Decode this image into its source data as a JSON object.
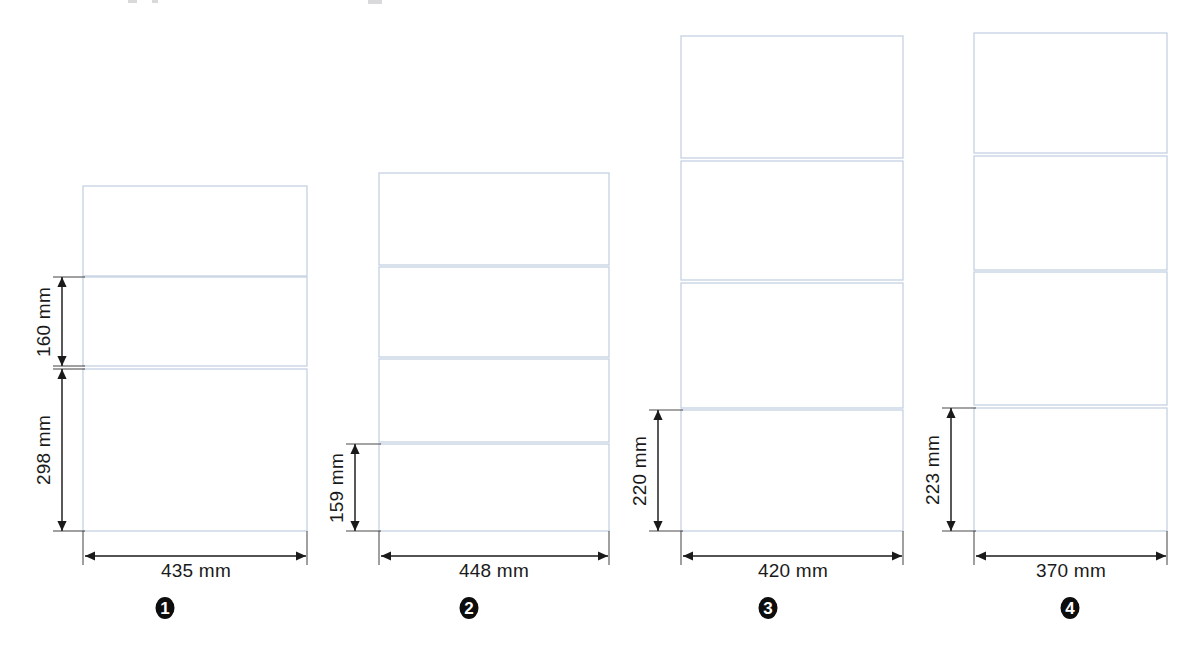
{
  "page": {
    "background_color": "#ffffff",
    "panel_stroke_color": "#c2cfe2",
    "dimension_stroke_color": "#1a1a1a",
    "marker_fill_color": "#0d0d0d",
    "marker_text_color": "#ffffff",
    "unit": "mm"
  },
  "figures": [
    {
      "id": "figure-1",
      "marker_label": "1",
      "marker_x": 165,
      "marker_y": 608,
      "panel_left": 83,
      "panel_right": 307,
      "panels": [
        {
          "name": "panel-top",
          "top": 186,
          "bottom": 276
        },
        {
          "name": "panel-middle",
          "top": 277,
          "bottom": 366
        },
        {
          "name": "panel-bottom",
          "top": 369,
          "bottom": 531
        }
      ],
      "vertical_dimensions": [
        {
          "name": "height-dim-160",
          "label": "160 mm",
          "value": 160,
          "line_x": 62,
          "top": 277,
          "bottom": 366,
          "text_x": 50,
          "text_y": 322
        },
        {
          "name": "height-dim-298",
          "label": "298 mm",
          "value": 298,
          "line_x": 62,
          "top": 369,
          "bottom": 531,
          "text_x": 50,
          "text_y": 450
        }
      ],
      "width_dimension": {
        "name": "width-dim-435",
        "label": "435 mm",
        "value": 435,
        "line_y": 556,
        "left": 85,
        "right": 306,
        "text_x": 196,
        "text_y": 577
      }
    },
    {
      "id": "figure-2",
      "marker_label": "2",
      "marker_x": 469,
      "marker_y": 608,
      "panel_left": 379,
      "panel_right": 609,
      "panels": [
        {
          "name": "panel-1",
          "top": 173,
          "bottom": 265
        },
        {
          "name": "panel-2",
          "top": 267,
          "bottom": 357
        },
        {
          "name": "panel-3",
          "top": 359,
          "bottom": 442
        },
        {
          "name": "panel-4",
          "top": 444,
          "bottom": 531
        }
      ],
      "vertical_dimensions": [
        {
          "name": "height-dim-159",
          "label": "159 mm",
          "value": 159,
          "line_x": 355,
          "top": 444,
          "bottom": 531,
          "text_x": 343,
          "text_y": 488
        }
      ],
      "width_dimension": {
        "name": "width-dim-448",
        "label": "448 mm",
        "value": 448,
        "line_y": 556,
        "left": 381,
        "right": 608,
        "text_x": 494,
        "text_y": 577
      }
    },
    {
      "id": "figure-3",
      "marker_label": "3",
      "marker_x": 768,
      "marker_y": 608,
      "panel_left": 681,
      "panel_right": 903,
      "panels": [
        {
          "name": "panel-1",
          "top": 36,
          "bottom": 158
        },
        {
          "name": "panel-2",
          "top": 161,
          "bottom": 280
        },
        {
          "name": "panel-3",
          "top": 283,
          "bottom": 408
        },
        {
          "name": "panel-4",
          "top": 410,
          "bottom": 531
        }
      ],
      "vertical_dimensions": [
        {
          "name": "height-dim-220",
          "label": "220 mm",
          "value": 220,
          "line_x": 658,
          "top": 410,
          "bottom": 531,
          "text_x": 646,
          "text_y": 471
        }
      ],
      "width_dimension": {
        "name": "width-dim-420",
        "label": "420 mm",
        "value": 420,
        "line_y": 556,
        "left": 683,
        "right": 902,
        "text_x": 793,
        "text_y": 577
      }
    },
    {
      "id": "figure-4",
      "marker_label": "4",
      "marker_x": 1070,
      "marker_y": 608,
      "panel_left": 974,
      "panel_right": 1167,
      "panels": [
        {
          "name": "panel-1",
          "top": 33,
          "bottom": 153
        },
        {
          "name": "panel-2",
          "top": 156,
          "bottom": 270
        },
        {
          "name": "panel-3",
          "top": 272,
          "bottom": 405
        },
        {
          "name": "panel-4",
          "top": 408,
          "bottom": 531
        }
      ],
      "vertical_dimensions": [
        {
          "name": "height-dim-223",
          "label": "223 mm",
          "value": 223,
          "line_x": 951,
          "top": 408,
          "bottom": 531,
          "text_x": 939,
          "text_y": 470
        }
      ],
      "width_dimension": {
        "name": "width-dim-370",
        "label": "370 mm",
        "value": 370,
        "line_y": 556,
        "left": 976,
        "right": 1166,
        "text_x": 1071,
        "text_y": 577
      }
    }
  ]
}
